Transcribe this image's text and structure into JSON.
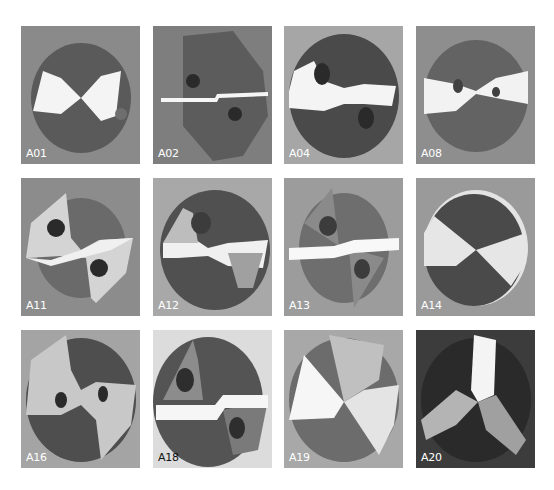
{
  "figure": {
    "rows": 3,
    "columns": 4,
    "tiles": [
      {
        "label": "A01",
        "row": 0,
        "col": 0
      },
      {
        "label": "A02",
        "row": 0,
        "col": 1
      },
      {
        "label": "A04",
        "row": 0,
        "col": 2
      },
      {
        "label": "A08",
        "row": 0,
        "col": 3
      },
      {
        "label": "A11",
        "row": 1,
        "col": 0
      },
      {
        "label": "A12",
        "row": 1,
        "col": 1
      },
      {
        "label": "A13",
        "row": 1,
        "col": 2
      },
      {
        "label": "A14",
        "row": 1,
        "col": 3
      },
      {
        "label": "A16",
        "row": 2,
        "col": 0
      },
      {
        "label": "A18",
        "row": 2,
        "col": 1
      },
      {
        "label": "A19",
        "row": 2,
        "col": 2
      },
      {
        "label": "A20",
        "row": 2,
        "col": 3
      }
    ]
  },
  "colors": {
    "background": "#ffffff",
    "label_light": "#ffffff",
    "label_dark": "#111111"
  }
}
